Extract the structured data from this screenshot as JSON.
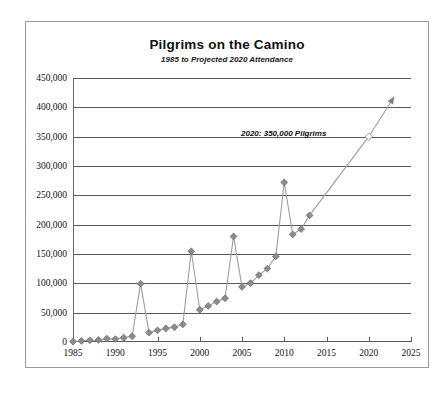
{
  "chart_data": {
    "type": "line",
    "title": "Pilgrims on the Camino",
    "subtitle": "1985 to Projected 2020 Attendance",
    "xlabel": "",
    "ylabel": "",
    "xlim": [
      1985,
      2025
    ],
    "ylim": [
      0,
      450000
    ],
    "grid": true,
    "legend": false,
    "xticks": [
      "1985",
      "1990",
      "1995",
      "2000",
      "2005",
      "2010",
      "2015",
      "2020",
      "2025"
    ],
    "xtick_values": [
      1985,
      1990,
      1995,
      2000,
      2005,
      2010,
      2015,
      2020,
      2025
    ],
    "yticks": [
      "0",
      "50,000",
      "100,000",
      "150,000",
      "200,000",
      "250,000",
      "300,000",
      "350,000",
      "400,000",
      "450,000"
    ],
    "ytick_values": [
      0,
      50000,
      100000,
      150000,
      200000,
      250000,
      300000,
      350000,
      400000,
      450000
    ],
    "marker": "diamond",
    "series": [
      {
        "name": "Pilgrims",
        "x": [
          1985,
          1986,
          1987,
          1988,
          1989,
          1990,
          1991,
          1992,
          1993,
          1994,
          1995,
          1996,
          1997,
          1998,
          1999,
          2000,
          2001,
          2002,
          2003,
          2004,
          2005,
          2006,
          2007,
          2008,
          2009,
          2010,
          2011,
          2012,
          2013
        ],
        "values": [
          690,
          1800,
          2905,
          3501,
          5760,
          4918,
          7274,
          9764,
          99436,
          15863,
          19821,
          23218,
          25179,
          30126,
          154613,
          55004,
          61418,
          68952,
          74614,
          179944,
          93924,
          100377,
          114026,
          125141,
          145877,
          272135,
          183366,
          192488,
          215880
        ],
        "style": "solid",
        "color": "#8c8c8c"
      },
      {
        "name": "Projection",
        "x": [
          2013,
          2020,
          2023
        ],
        "values": [
          215880,
          350000,
          418000
        ],
        "style": "solid-arrow",
        "color": "#8c8c8c"
      }
    ],
    "annotations": [
      {
        "text": "2020: 350,000 Pilgrims",
        "x": 2020,
        "y": 350000
      }
    ],
    "projected_point": {
      "x": 2020,
      "y": 350000,
      "marker": "open-diamond"
    },
    "colors": {
      "marker": "#8c8c8c",
      "line": "#9e9e9e",
      "grid": "#5a5a5a",
      "frame": "#9a9a9a",
      "text": "#101010"
    }
  }
}
